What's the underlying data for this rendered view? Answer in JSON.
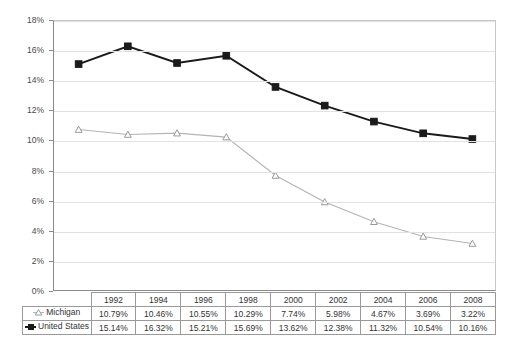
{
  "chart_data": {
    "type": "line",
    "title": "",
    "xlabel": "",
    "ylabel": "",
    "ylim": [
      0,
      18
    ],
    "ytick_labels": [
      "0%",
      "2%",
      "4%",
      "6%",
      "8%",
      "10%",
      "12%",
      "14%",
      "16%",
      "18%"
    ],
    "ytick_values": [
      0,
      2,
      4,
      6,
      8,
      10,
      12,
      14,
      16,
      18
    ],
    "grid": true,
    "legend_position": "table-left",
    "categories": [
      "1992",
      "1994",
      "1996",
      "1998",
      "2000",
      "2002",
      "2004",
      "2006",
      "2008"
    ],
    "series": [
      {
        "name": "Michigan",
        "marker": "open-triangle",
        "color": "#b4b4b4",
        "values": [
          10.79,
          10.46,
          10.55,
          10.29,
          7.74,
          5.98,
          4.67,
          3.69,
          3.22
        ],
        "labels": [
          "10.79%",
          "10.46%",
          "10.55%",
          "10.29%",
          "7.74%",
          "5.98%",
          "4.67%",
          "3.69%",
          "3.22%"
        ]
      },
      {
        "name": "United States",
        "marker": "filled-square",
        "color": "#1a1a1a",
        "values": [
          15.14,
          16.32,
          15.21,
          15.69,
          13.62,
          12.38,
          11.32,
          10.54,
          10.16
        ],
        "labels": [
          "15.14%",
          "16.32%",
          "15.21%",
          "15.69%",
          "13.62%",
          "12.38%",
          "11.32%",
          "10.54%",
          "10.16%"
        ]
      }
    ]
  },
  "table": {
    "corner_label": "",
    "header": [
      "1992",
      "1994",
      "1996",
      "1998",
      "2000",
      "2002",
      "2004",
      "2006",
      "2008"
    ],
    "rows": [
      {
        "label": "Michigan",
        "marker": "open-triangle",
        "cells": [
          "10.79%",
          "10.46%",
          "10.55%",
          "10.29%",
          "7.74%",
          "5.98%",
          "4.67%",
          "3.69%",
          "3.22%"
        ]
      },
      {
        "label": "United States",
        "marker": "filled-square",
        "cells": [
          "15.14%",
          "16.32%",
          "15.21%",
          "15.69%",
          "13.62%",
          "12.38%",
          "11.32%",
          "10.54%",
          "10.16%"
        ]
      }
    ]
  },
  "colors": {
    "michigan_line": "#b4b4b4",
    "us_line": "#1a1a1a",
    "gridline": "#e2e2e2",
    "axis": "#8a8a8a",
    "background": "#ffffff"
  }
}
